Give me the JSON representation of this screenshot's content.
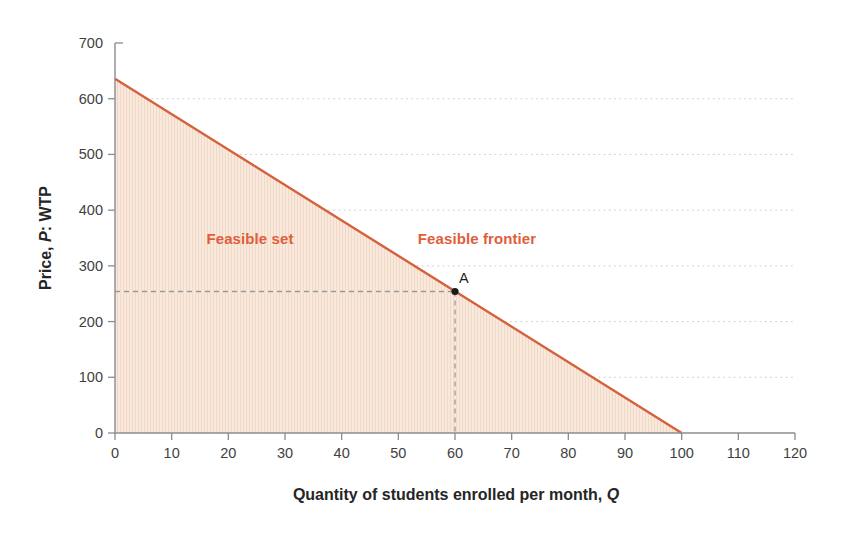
{
  "labels": {
    "y_axis_prefix": "Price, ",
    "y_axis_var": "P",
    "y_axis_suffix": ": WTP",
    "x_axis_prefix": "Quantity of students enrolled per month, ",
    "x_axis_var": "Q",
    "feasible_set": "Feasible set",
    "feasible_frontier": "Feasible frontier",
    "point_a": "A"
  },
  "colors": {
    "frontier_line": "#d4603c",
    "annotation_text": "#e05e3c",
    "area_fill": "#f9e9dd",
    "area_stripe": "#f2d8c6",
    "gridline": "#c9c9c9",
    "axis_line": "#8c8c8c",
    "tick_text": "#3f3f3f",
    "title_text": "#252525",
    "guide_dash": "#9a9a9a",
    "point_marker": "#1a1a1a"
  },
  "chart_data": {
    "type": "line",
    "title": "",
    "xlabel": "Quantity of students enrolled per month, Q",
    "ylabel": "Price, P: WTP",
    "xlim": [
      0,
      120
    ],
    "ylim": [
      0,
      700
    ],
    "x_ticks": [
      0,
      10,
      20,
      30,
      40,
      50,
      60,
      70,
      80,
      90,
      100,
      110,
      120
    ],
    "y_ticks": [
      0,
      100,
      200,
      300,
      400,
      500,
      600,
      700
    ],
    "grid_lines_y": [
      100,
      200,
      300,
      400,
      500,
      600
    ],
    "grid_style": "dotted horizontal",
    "legend": "none",
    "series": [
      {
        "name": "Feasible frontier",
        "x": [
          0,
          100
        ],
        "y": [
          636,
          0
        ],
        "style": "solid",
        "area_under_name": "Feasible set"
      }
    ],
    "annotations": [
      {
        "label": "Feasible set",
        "x": 24,
        "y": 348,
        "kind": "text"
      },
      {
        "label": "Feasible frontier",
        "x": 64,
        "y": 348,
        "kind": "text"
      },
      {
        "label": "A",
        "x": 60,
        "y": 254,
        "kind": "point",
        "guides": "dashed lines to both axes"
      }
    ]
  }
}
